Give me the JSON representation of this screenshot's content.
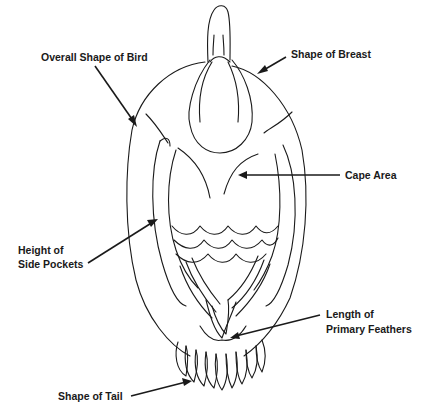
{
  "diagram": {
    "labels": {
      "overall_shape": "Overall Shape of Bird",
      "breast": "Shape of Breast",
      "cape": "Cape Area",
      "side_pockets_1": "Height of",
      "side_pockets_2": "Side Pockets",
      "primary_1": "Length of",
      "primary_2": "Primary Feathers",
      "tail": "Shape of Tail"
    },
    "colors": {
      "line": "#1a1a1a",
      "background": "#ffffff"
    }
  }
}
